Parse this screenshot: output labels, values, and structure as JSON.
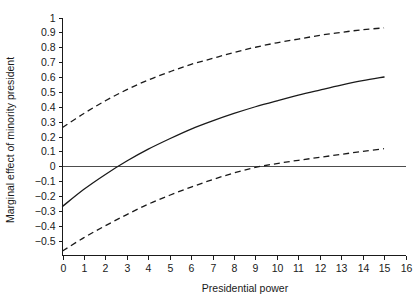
{
  "chart_data": {
    "type": "line",
    "title": "",
    "xlabel": "Presidential power",
    "ylabel": "Marginal effect of minority president",
    "xlim": [
      0,
      16
    ],
    "ylim": [
      -0.6,
      1.0
    ],
    "grid": false,
    "legend": "none",
    "xticks": [
      0,
      1,
      2,
      3,
      4,
      5,
      6,
      7,
      8,
      9,
      10,
      11,
      12,
      13,
      14,
      15,
      16
    ],
    "xtick_labels": [
      "0",
      "1",
      "2",
      "3",
      "4",
      "5",
      "6",
      "7",
      "8",
      "9",
      "10",
      "11",
      "12",
      "13",
      "14",
      "15",
      "16"
    ],
    "yticks": [
      -0.5,
      -0.4,
      -0.3,
      -0.2,
      -0.1,
      0,
      0.1,
      0.2,
      0.3,
      0.4,
      0.5,
      0.6,
      0.7,
      0.8,
      0.9,
      1
    ],
    "ytick_labels": [
      "−0.5",
      "−0.4",
      "−0.3",
      "−0.2",
      "−0.1",
      "0",
      "0.1",
      "0.2",
      "0.3",
      "0.4",
      "0.5",
      "0.6",
      "0.7",
      "0.8",
      "0.9",
      "1"
    ],
    "reference_line": {
      "name": "zero-reference-line",
      "y": 0,
      "style": "solid",
      "x_start": 0,
      "x_end": 16
    },
    "x": [
      0,
      1,
      2,
      3,
      4,
      5,
      6,
      7,
      8,
      9,
      10,
      11,
      12,
      13,
      14,
      15
    ],
    "series": [
      {
        "name": "upper-confidence-bound",
        "style": "dashed",
        "values": [
          0.26,
          0.355,
          0.44,
          0.515,
          0.58,
          0.635,
          0.685,
          0.725,
          0.765,
          0.8,
          0.83,
          0.855,
          0.88,
          0.9,
          0.918,
          0.93
        ]
      },
      {
        "name": "marginal-effect-estimate",
        "style": "solid",
        "values": [
          -0.27,
          -0.155,
          -0.055,
          0.035,
          0.115,
          0.185,
          0.25,
          0.305,
          0.355,
          0.4,
          0.44,
          0.478,
          0.512,
          0.545,
          0.575,
          0.6
        ]
      },
      {
        "name": "lower-confidence-bound",
        "style": "dashed",
        "values": [
          -0.57,
          -0.48,
          -0.4,
          -0.325,
          -0.255,
          -0.195,
          -0.14,
          -0.09,
          -0.045,
          -0.008,
          0.018,
          0.04,
          0.06,
          0.08,
          0.1,
          0.118
        ]
      }
    ],
    "annotations": {
      "estimate_zero_crossing_x": 2.4,
      "lower_bound_zero_crossing_x": 7.0
    }
  }
}
